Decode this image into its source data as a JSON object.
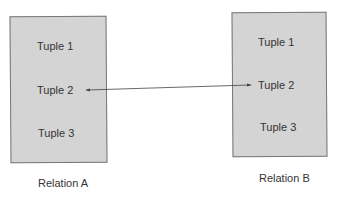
{
  "relations": [
    {
      "name": "Relation A",
      "tuples": [
        "Tuple 1",
        "Tuple 2",
        "Tuple 3"
      ]
    },
    {
      "name": "Relation B",
      "tuples": [
        "Tuple 1",
        "Tuple 2",
        "Tuple 3"
      ]
    }
  ],
  "link": {
    "from": "Relation A / Tuple 2",
    "to": "Relation B / Tuple 2",
    "style": "double-headed arrow"
  },
  "colors": {
    "box_fill": "#d4d4d4",
    "box_border": "#777777",
    "text": "#333333",
    "line": "#444444"
  }
}
